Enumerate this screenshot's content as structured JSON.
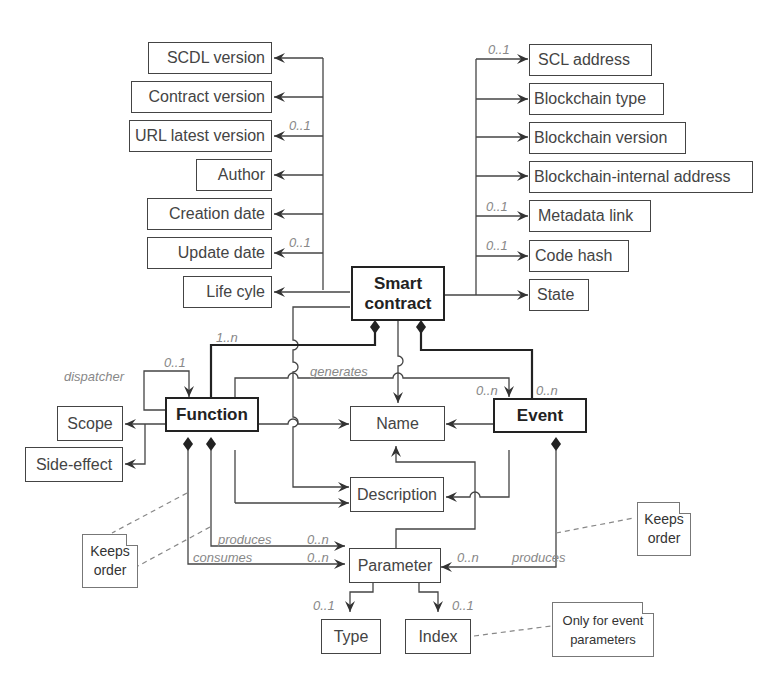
{
  "diagram": {
    "type": "UML class diagram",
    "central": "Smart contract",
    "left_attributes": [
      {
        "label": "SCDL version",
        "multiplicity": ""
      },
      {
        "label": "Contract version",
        "multiplicity": ""
      },
      {
        "label": "URL latest version",
        "multiplicity": "0..1"
      },
      {
        "label": "Author",
        "multiplicity": ""
      },
      {
        "label": "Creation date",
        "multiplicity": ""
      },
      {
        "label": "Update date",
        "multiplicity": "0..1"
      },
      {
        "label": "Life cyle",
        "multiplicity": ""
      }
    ],
    "right_attributes": [
      {
        "label": "SCL address",
        "multiplicity": "0..1"
      },
      {
        "label": "Blockchain type",
        "multiplicity": ""
      },
      {
        "label": "Blockchain version",
        "multiplicity": ""
      },
      {
        "label": "Blockchain-internal address",
        "multiplicity": ""
      },
      {
        "label": "Metadata link",
        "multiplicity": "0..1"
      },
      {
        "label": "Code hash",
        "multiplicity": "0..1"
      },
      {
        "label": "State",
        "multiplicity": ""
      }
    ],
    "entities": {
      "smart_contract": "Smart contract",
      "function": "Function",
      "event": "Event",
      "name": "Name",
      "description": "Description",
      "parameter": "Parameter",
      "scope": "Scope",
      "side_effect": "Side-effect",
      "type": "Type",
      "index": "Index"
    },
    "labels": {
      "function_mult": "1..n",
      "dispatcher": "dispatcher",
      "dispatcher_mult": "0..1",
      "generates": "generates",
      "generates_mult": "0..n",
      "event_mult": "0..n",
      "produces_fn": "produces",
      "produces_fn_mult": "0..n",
      "consumes": "consumes",
      "consumes_mult": "0..n",
      "produces_ev": "produces",
      "produces_ev_mult": "0..n",
      "type_mult": "0..1",
      "index_mult": "0..1"
    },
    "notes": {
      "keeps_order_left": "Keeps order",
      "keeps_order_right": "Keeps order",
      "only_event_params": "Only for event parameters"
    }
  }
}
